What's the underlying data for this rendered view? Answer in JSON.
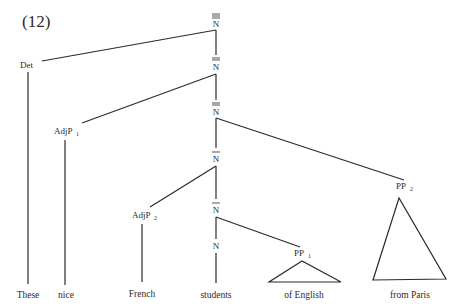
{
  "example_number": "(12)",
  "nodes": {
    "n3": "N",
    "n2a": "N",
    "n2b": "N",
    "n1a": "N",
    "n1b": "N",
    "n0": "N",
    "det": "Det",
    "adjp1": "AdjP",
    "adjp1_sub": "1",
    "adjp2": "AdjP",
    "adjp2_sub": "2",
    "pp1": "PP",
    "pp1_sub": "1",
    "pp2": "PP",
    "pp2_sub": "2"
  },
  "words": [
    "These",
    "nice",
    "French",
    "students",
    "of English",
    "from Paris"
  ],
  "colors": {
    "ink": "#2a2a2a",
    "background": "#ffffff"
  }
}
